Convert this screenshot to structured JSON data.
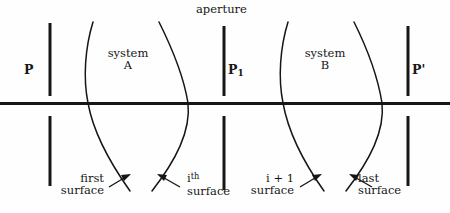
{
  "figure": {
    "type": "optical-system-diagram",
    "background_color": "#fefefe",
    "ink_color": "#161616",
    "axis": {
      "name": "optical-axis",
      "y": 103,
      "x_start": 0,
      "x_end": 450,
      "thickness": 3
    }
  },
  "planes": [
    {
      "id": "P",
      "label": "P",
      "label_side": "left",
      "x": 50,
      "top_segment": [
        23,
        96
      ],
      "bottom_segment": [
        116,
        186
      ],
      "label_x": 24,
      "label_y": 70
    },
    {
      "id": "P1",
      "label_main": "P",
      "label_sub": "1",
      "label_side": "right",
      "x": 224,
      "top_segment": [
        26,
        96
      ],
      "bottom_segment": [
        116,
        190
      ],
      "label_x": 228,
      "label_y": 70
    },
    {
      "id": "Pprime",
      "label_main": "P",
      "label_prime": "'",
      "label_side": "right",
      "x": 408,
      "top_segment": [
        26,
        96
      ],
      "bottom_segment": [
        116,
        186
      ],
      "label_x": 412,
      "label_y": 70
    }
  ],
  "aperture": {
    "label": "aperture",
    "label_x": 196,
    "label_y": 4,
    "points_to_plane": "P1"
  },
  "systems": [
    {
      "id": "A",
      "name_line1": "system",
      "name_line2": "A",
      "label_x": 99,
      "label_y": 48,
      "left_surface": {
        "top_x": 92,
        "waist_x": 86,
        "bottom_x": 128
      },
      "right_surface": {
        "top_x": 160,
        "waist_x": 190,
        "bottom_x": 152
      }
    },
    {
      "id": "B",
      "name_line1": "system",
      "name_line2": "B",
      "label_x": 296,
      "label_y": 48,
      "left_surface": {
        "top_x": 288,
        "waist_x": 280,
        "bottom_x": 322
      },
      "right_surface": {
        "top_x": 356,
        "waist_x": 384,
        "bottom_x": 346
      }
    }
  ],
  "surface_callouts": [
    {
      "id": "first-surface",
      "line1": "first",
      "line2": "surface",
      "label_x": 58,
      "label_y": 174,
      "arrow_from": [
        112,
        185
      ],
      "arrow_to": [
        128,
        176
      ]
    },
    {
      "id": "ith-surface",
      "line1_base": "i",
      "line1_sup": "th",
      "line2": "surface",
      "label_x": 163,
      "label_y": 174,
      "arrow_from": [
        176,
        185
      ],
      "arrow_to": [
        159,
        176
      ]
    },
    {
      "id": "i-plus-1-surface",
      "line1": "i + 1",
      "line2": "surface",
      "label_x": 246,
      "label_y": 174,
      "arrow_from": [
        303,
        185
      ],
      "arrow_to": [
        319,
        176
      ]
    },
    {
      "id": "last-surface",
      "line1": "last",
      "line2": "surface",
      "label_x": 355,
      "label_y": 174,
      "arrow_from": [
        368,
        185
      ],
      "arrow_to": [
        351,
        176
      ]
    }
  ]
}
